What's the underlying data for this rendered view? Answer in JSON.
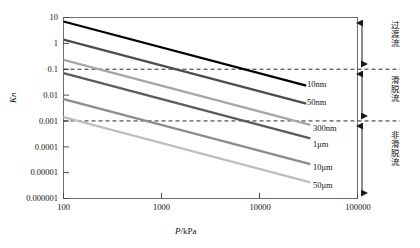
{
  "chart_data": {
    "type": "line",
    "title": "",
    "xlabel": "P/kPa",
    "ylabel": "Kn",
    "xscale": "log",
    "yscale": "log",
    "xlim": [
      100,
      100000
    ],
    "ylim": [
      1e-06,
      10
    ],
    "grid": false,
    "legend_position": "inline-right-of-line-end",
    "xticks": [
      "100",
      "1000",
      "10000",
      "100000"
    ],
    "yticks": [
      "10",
      "1",
      "0.1",
      "0.01",
      "0.001",
      "0.0001",
      "0.00001",
      "0.000001"
    ],
    "threshold_lines": [
      {
        "value": 0.1,
        "style": "dashed",
        "label": ""
      },
      {
        "value": 0.001,
        "style": "dashed",
        "label": ""
      }
    ],
    "annotations": [
      {
        "text": "过渡流",
        "meaning": "transition-flow",
        "range": [
          0.1,
          10
        ]
      },
      {
        "text": "滑脱流",
        "meaning": "slip-flow",
        "range": [
          0.001,
          0.1
        ]
      },
      {
        "text": "非滑脱流",
        "meaning": "non-slip-flow",
        "range": [
          1e-06,
          0.001
        ]
      }
    ],
    "series": [
      {
        "name": "10nm",
        "color": "#000000",
        "x": [
          100,
          30000
        ],
        "y": [
          7.0,
          0.0233
        ]
      },
      {
        "name": "50nm",
        "color": "#4d4d4d",
        "x": [
          100,
          30000
        ],
        "y": [
          1.4,
          0.00466
        ]
      },
      {
        "name": "300nm",
        "color": "#a6a6a6",
        "x": [
          100,
          33000
        ],
        "y": [
          0.23,
          0.000697
        ]
      },
      {
        "name": "1μm",
        "color": "#5c5c5c",
        "x": [
          100,
          33000
        ],
        "y": [
          0.07,
          0.000212
        ]
      },
      {
        "name": "10μm",
        "color": "#8c8c8c",
        "x": [
          100,
          33000
        ],
        "y": [
          0.007,
          2.12e-05
        ]
      },
      {
        "name": "50μm",
        "color": "#bfbfbf",
        "x": [
          100,
          33000
        ],
        "y": [
          0.0014,
          4.24e-06
        ]
      }
    ]
  },
  "axis": {
    "y_title": "Kn",
    "x_title_var": "P",
    "x_title_sep": "/",
    "x_title_unit": "kPa"
  },
  "yticks": {
    "t0": "10",
    "t1": "1",
    "t2": "0.1",
    "t3": "0.01",
    "t4": "0.001",
    "t5": "0.0001",
    "t6": "0.00001",
    "t7": "0.000001"
  },
  "xticks": {
    "t0": "100",
    "t1": "1000",
    "t2": "10000",
    "t3": "100000"
  },
  "series_labels": {
    "s0": "10nm",
    "s1": "50nm",
    "s2": "300nm",
    "s3": "1μm",
    "s4": "10μm",
    "s5": "50μm"
  },
  "regimes": {
    "r0": "过渡流",
    "r1": "滑脱流",
    "r2": "非滑脱流"
  }
}
